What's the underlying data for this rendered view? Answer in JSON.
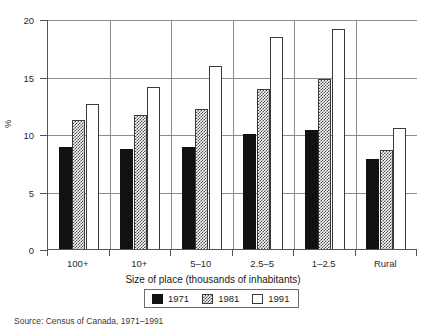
{
  "chart_data": {
    "type": "bar",
    "title": "",
    "xlabel": "Size of place (thousands of inhabitants)",
    "ylabel": "%",
    "ylim": [
      0,
      20
    ],
    "yticks": [
      0,
      5,
      10,
      15,
      20
    ],
    "grid": true,
    "legend_position": "bottom-center",
    "categories": [
      "100+",
      "10+",
      "5–10",
      "2.5–5",
      "1–2.5",
      "Rural"
    ],
    "series": [
      {
        "name": "1971",
        "color": "#111111",
        "fill": "solid",
        "values": [
          9.0,
          8.8,
          9.0,
          10.1,
          10.4,
          7.9
        ]
      },
      {
        "name": "1981",
        "color": "#4a4a4a",
        "fill": "checkerboard",
        "values": [
          11.3,
          11.7,
          12.3,
          14.0,
          14.9,
          8.7
        ]
      },
      {
        "name": "1991",
        "color": "#ffffff",
        "fill": "outline",
        "values": [
          12.7,
          14.2,
          16.0,
          18.5,
          19.2,
          10.6
        ]
      }
    ],
    "source": "Source: Census of Canada, 1971–1991"
  }
}
